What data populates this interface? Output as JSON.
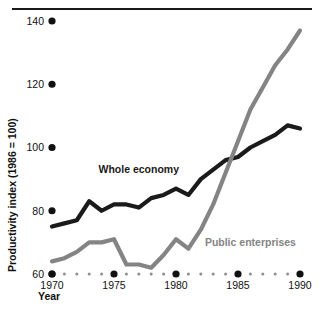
{
  "chart_data": {
    "type": "line",
    "title": "",
    "xlabel": "Year",
    "ylabel": "Productivity index (1986 = 100)",
    "xlim": [
      1970,
      1990
    ],
    "ylim": [
      60,
      140
    ],
    "yticks": [
      60,
      80,
      100,
      120,
      140
    ],
    "xticks": [
      1970,
      1975,
      1980,
      1985,
      1990
    ],
    "xticklabels": [
      "1970",
      "1975",
      "1980",
      "1985",
      "1990"
    ],
    "yticklabels": [
      "60",
      "80",
      "100",
      "120",
      "140"
    ],
    "grid": false,
    "legend_position": "inline-annotation",
    "x": [
      1970,
      1971,
      1972,
      1973,
      1974,
      1975,
      1976,
      1977,
      1978,
      1979,
      1980,
      1981,
      1982,
      1983,
      1984,
      1985,
      1986,
      1987,
      1988,
      1989,
      1990
    ],
    "series": [
      {
        "name": "Whole economy",
        "color": "#1a1a1a",
        "values": [
          75,
          76,
          77,
          83,
          80,
          82,
          82,
          81,
          84,
          85,
          87,
          85,
          90,
          93,
          96,
          97,
          100,
          102,
          104,
          107,
          106
        ]
      },
      {
        "name": "Public enterprises",
        "color": "#848484",
        "values": [
          64,
          65,
          67,
          70,
          70,
          71,
          63,
          63,
          62,
          66,
          71,
          68,
          74,
          82,
          92,
          102,
          112,
          119,
          126,
          131,
          137
        ]
      }
    ],
    "annotations": [
      {
        "text": "Whole economy",
        "x": 1977,
        "y": 92,
        "color": "#1a1a1a"
      },
      {
        "text": "Public enterprises",
        "x": 1986,
        "y": 69,
        "color": "#848484"
      }
    ]
  },
  "axis": {
    "y_title": "Productivity index (1986 = 100)",
    "x_title": "Year"
  }
}
